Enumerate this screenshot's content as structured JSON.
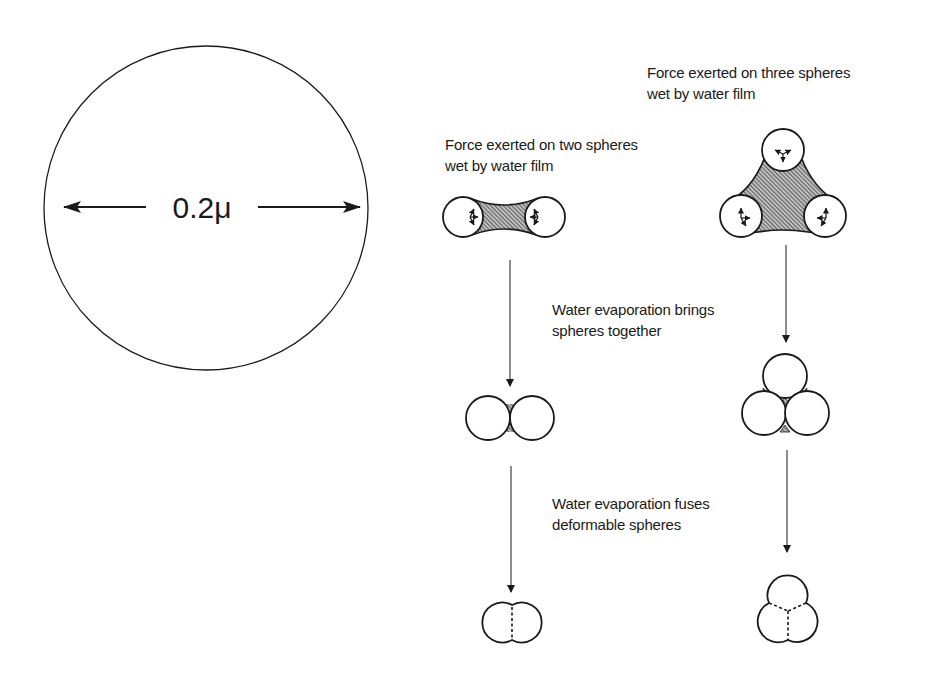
{
  "figure": {
    "scale_circle": {
      "label": "0.2μ",
      "description": "single sphere with diameter dimension arrow"
    },
    "labels": {
      "two_spheres_line1": "Force exerted on two spheres",
      "two_spheres_line2": "wet by water film",
      "three_spheres_line1": "Force exerted on three spheres",
      "three_spheres_line2": "wet by water film",
      "step1_line1": "Water evaporation brings",
      "step1_line2": "spheres together",
      "step2_line1": "Water evaporation fuses",
      "step2_line2": "deformable spheres"
    },
    "stages": [
      {
        "name": "wet-film",
        "pair": "two spheres separated by hatched water film with force arrows",
        "trio": "three spheres joined by hatched water film with force arrows"
      },
      {
        "name": "brought-together",
        "pair": "two touching spheres with residual film at contact",
        "trio": "three touching spheres with residual film at contacts"
      },
      {
        "name": "fused",
        "pair": "two fused spheres with dashed boundary",
        "trio": "three fused spheres with dashed boundaries"
      }
    ],
    "colors": {
      "ink": "#1a1a1a",
      "background": "#ffffff"
    }
  }
}
